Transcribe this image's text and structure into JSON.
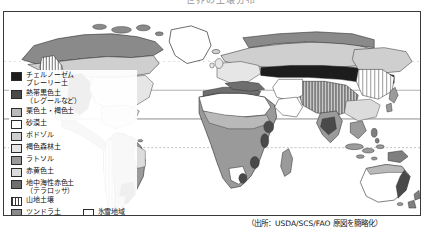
{
  "figure": {
    "top_title_fragment": "世界の土壌分布",
    "source_note": "（出所：USDA/SCS/FAO 原図を簡略化）"
  },
  "map": {
    "projection_label": "world-map",
    "graticule": {
      "equator_label": "equator",
      "tropic_cancer_label": "tropic-of-cancer",
      "tropic_capricorn_label": "tropic-of-capricorn"
    }
  },
  "legend": {
    "items": [
      {
        "id": "chernozem",
        "label": "チェルノーゼム\nプレーリー土",
        "swatch_class": "sw-chernozem",
        "color": "#1d1d1d"
      },
      {
        "id": "tropical-black",
        "label": "熱帯黒色土\n（レグールなど）",
        "swatch_class": "sw-tropblack",
        "color": "#4a4a4a"
      },
      {
        "id": "chestnut-brown",
        "label": "栗色土・褐色土",
        "swatch_class": "sw-chestnut",
        "color": "#b9b9b9"
      },
      {
        "id": "desert",
        "label": "砂漠土",
        "swatch_class": "sw-desert",
        "color": "#ffffff"
      },
      {
        "id": "podzol",
        "label": "ポドゾル",
        "swatch_class": "sw-podzol",
        "color": "#cfcfcf"
      },
      {
        "id": "brown-forest",
        "label": "褐色森林土",
        "swatch_class": "sw-brownforest",
        "color": "#e6e6e6"
      },
      {
        "id": "latosol",
        "label": "ラトソル",
        "swatch_class": "sw-latosol",
        "color": "#9a9a9a"
      },
      {
        "id": "red-yellow",
        "label": "赤黄色土",
        "swatch_class": "sw-redyellow",
        "color": "#dcdcdc"
      },
      {
        "id": "terra-rossa",
        "label": "地中海性赤色土\n（テラロッサ）",
        "swatch_class": "sw-terrarossa",
        "color": "#6e6e6e"
      },
      {
        "id": "mountain-soil",
        "label": "山地土壌",
        "swatch_class": "sw-mountain",
        "color": "#3a3a3a"
      }
    ],
    "bottom_row": {
      "tundra": {
        "id": "tundra",
        "label": "ツンドラ土",
        "swatch_class": "sw-tundra",
        "color": "#8a8a8a"
      },
      "icefield": {
        "id": "icefield",
        "label": "氷雪地域",
        "swatch_class": "sw-icefield",
        "color": "#ffffff"
      }
    }
  }
}
